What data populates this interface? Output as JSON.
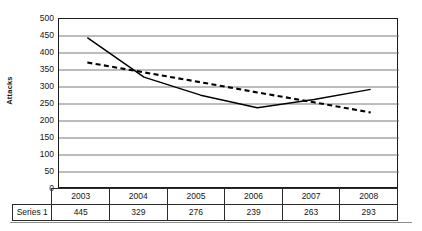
{
  "chart_data": {
    "type": "line",
    "title": "",
    "xlabel": "",
    "ylabel": "Attacks",
    "categories": [
      "2003",
      "2004",
      "2005",
      "2006",
      "2007",
      "2008"
    ],
    "ylim": [
      0,
      500
    ],
    "ytick_step": 50,
    "yticks": [
      500,
      450,
      400,
      350,
      300,
      250,
      200,
      150,
      100,
      50,
      0
    ],
    "grid": "horizontal",
    "legend": "none",
    "series": [
      {
        "name": "Series 1",
        "style": "solid",
        "color": "#000000",
        "values": [
          445,
          329,
          276,
          239,
          263,
          293
        ]
      },
      {
        "name": "Trendline",
        "style": "dashed",
        "color": "#000000",
        "values": [
          372,
          343,
          314,
          284,
          255,
          225
        ]
      }
    ]
  },
  "axis": {
    "y_title": "Attacks",
    "tick_labels": [
      "500",
      "450",
      "400",
      "350",
      "300",
      "250",
      "200",
      "150",
      "100",
      "50",
      "0"
    ]
  },
  "table": {
    "corner_label": "",
    "row_label": "Series 1",
    "headers": [
      "2003",
      "2004",
      "2005",
      "2006",
      "2007",
      "2008"
    ],
    "values": [
      "445",
      "329",
      "276",
      "239",
      "263",
      "293"
    ]
  },
  "style": {
    "frame_color": "#1a1a1a",
    "gridline_color": "#6b6b6b",
    "series_color": "#000000",
    "background": "#ffffff"
  }
}
